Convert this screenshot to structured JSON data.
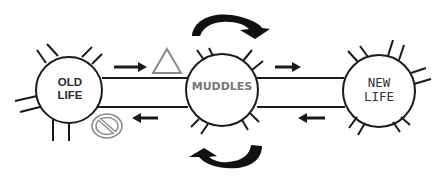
{
  "diagram": {
    "nodes": [
      {
        "id": "old-life",
        "lines": [
          "OLD",
          "LIFE"
        ]
      },
      {
        "id": "muddles",
        "lines": [
          "MUDDLES"
        ]
      },
      {
        "id": "new-life",
        "lines": [
          "NEW",
          "LIFE"
        ]
      }
    ],
    "symbols": {
      "triangle": "warning-triangle",
      "no_entry": "no-entry-sign",
      "cycle_top": "clockwise-curved-arrow",
      "cycle_bottom": "counterclockwise-curved-arrow"
    },
    "colors": {
      "stroke": "#1a1a1a",
      "muddles_text": "#777777",
      "symbol_outline": "#8a8a8a"
    }
  }
}
